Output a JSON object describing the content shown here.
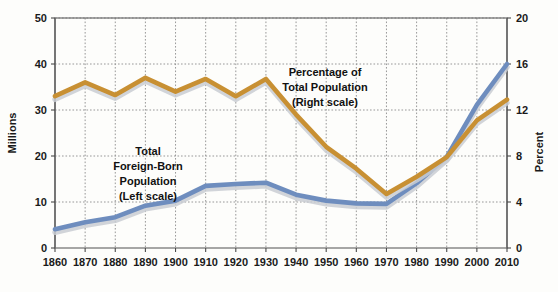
{
  "chart_data": {
    "type": "line",
    "title": "",
    "xlabel": "",
    "categories": [
      1860,
      1870,
      1880,
      1890,
      1900,
      1910,
      1920,
      1930,
      1940,
      1950,
      1960,
      1970,
      1980,
      1990,
      2000,
      2010
    ],
    "x_tick_labels": [
      "1860",
      "1870",
      "1880",
      "1890",
      "1900",
      "1910",
      "1920",
      "1930",
      "1940",
      "1950",
      "1960",
      "1970",
      "1980",
      "1990",
      "2000",
      "2010"
    ],
    "grid": true,
    "legend_position": "inline-annotation",
    "left_axis": {
      "label": "Millions",
      "ticks": [
        0,
        10,
        20,
        30,
        40,
        50
      ],
      "tick_labels": [
        "0",
        "10",
        "20",
        "30",
        "40",
        "50"
      ],
      "ylim": [
        0,
        50
      ]
    },
    "right_axis": {
      "label": "Percent",
      "ticks": [
        0,
        4,
        8,
        12,
        16,
        20
      ],
      "tick_labels": [
        "0",
        "4",
        "8",
        "12",
        "16",
        "20"
      ],
      "ylim": [
        0,
        20
      ]
    },
    "series": [
      {
        "name": "Total Foreign-Born Population",
        "axis": "left",
        "unit": "millions",
        "color": "#6E8DBE",
        "annotation": "Total\nForeign-Born\nPopulation\n(Left scale)",
        "values": [
          4.1,
          5.6,
          6.7,
          9.2,
          10.3,
          13.5,
          13.9,
          14.2,
          11.6,
          10.3,
          9.7,
          9.6,
          14.1,
          19.8,
          31.1,
          40.0
        ]
      },
      {
        "name": "Percentage of Total Population",
        "axis": "right",
        "unit": "percent",
        "color": "#C89033",
        "annotation": "Percentage of\nTotal Population\n(Right scale)",
        "values": [
          13.2,
          14.4,
          13.3,
          14.8,
          13.6,
          14.7,
          13.2,
          14.7,
          11.6,
          8.8,
          6.9,
          4.7,
          6.2,
          7.9,
          11.1,
          12.9
        ]
      }
    ]
  },
  "annotations": {
    "left_series": {
      "line1": "Total",
      "line2": "Foreign-Born",
      "line3": "Population",
      "line4": "(Left scale)"
    },
    "right_series": {
      "line1": "Percentage of",
      "line2": "Total Population",
      "line3": "(Right scale)"
    }
  },
  "colors": {
    "series_blue": "#6E8DBE",
    "series_gold": "#C89033",
    "shadow": "#c9ccd2",
    "grid": "#8d8d8d",
    "axis": "#6a6a6a",
    "text": "#1a1a1a",
    "background": "#fdfdfb"
  }
}
